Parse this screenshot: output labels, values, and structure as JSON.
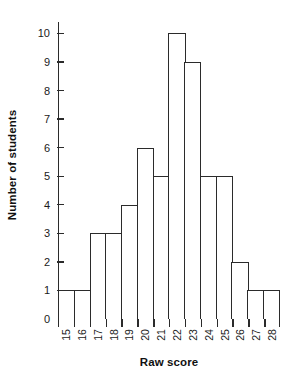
{
  "chart_data": {
    "type": "bar",
    "title": "",
    "subtitle": "",
    "xlabel": "Raw score",
    "ylabel": "Number of students",
    "categories": [
      "15",
      "16",
      "17",
      "18",
      "19",
      "20",
      "21",
      "22",
      "23",
      "24",
      "25",
      "26",
      "27",
      "28"
    ],
    "values": [
      1,
      1,
      3,
      3,
      4,
      6,
      5,
      10,
      9,
      5,
      5,
      2,
      1,
      1
    ],
    "yticks": [
      "0",
      "1",
      "2",
      "3",
      "4",
      "5",
      "6",
      "7",
      "8",
      "9",
      "10"
    ],
    "ylim": [
      0,
      10.4
    ],
    "grid": false,
    "legend": null,
    "legend_position": "none",
    "bar_fill_color": "#ffffff",
    "bar_edge_color": "#2b2b2b",
    "axis_color": "#2b2b2b",
    "text_color": "#1a1a1a",
    "background_color": "#ffffff",
    "annotations": []
  }
}
